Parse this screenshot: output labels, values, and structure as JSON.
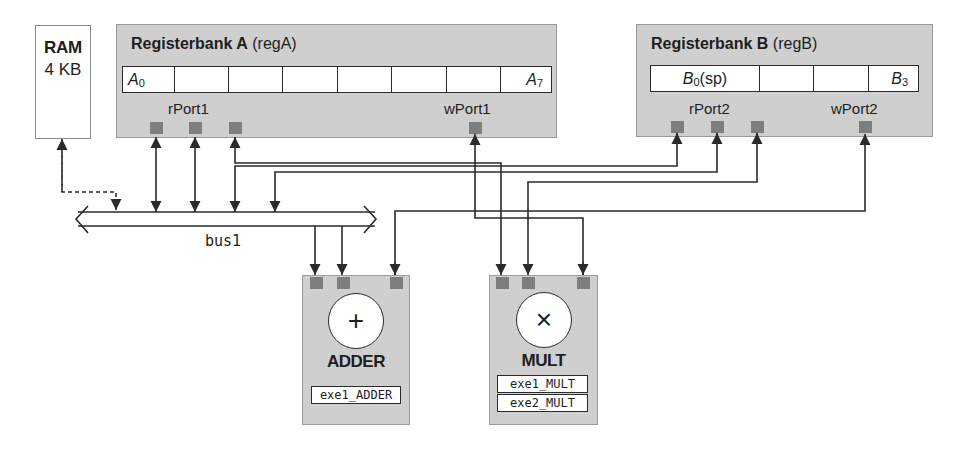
{
  "ram": {
    "title": "RAM",
    "size": "4 KB"
  },
  "register_bank_a": {
    "title_bold": "Registerbank A",
    "title_suffix": "(regA)",
    "cells": [
      {
        "reg": "A",
        "sub": "0"
      },
      {
        "reg": "",
        "sub": ""
      },
      {
        "reg": "",
        "sub": ""
      },
      {
        "reg": "",
        "sub": ""
      },
      {
        "reg": "",
        "sub": ""
      },
      {
        "reg": "",
        "sub": ""
      },
      {
        "reg": "",
        "sub": ""
      },
      {
        "reg": "A",
        "sub": "7"
      }
    ],
    "read_port_label": "rPort1",
    "write_port_label": "wPort1"
  },
  "register_bank_b": {
    "title_bold": "Registerbank B",
    "title_suffix": "(regB)",
    "cells": [
      {
        "reg": "B",
        "sub": "0",
        "extra": " (sp)"
      },
      {
        "reg": "",
        "sub": ""
      },
      {
        "reg": "",
        "sub": ""
      },
      {
        "reg": "B",
        "sub": "3"
      }
    ],
    "read_port_label": "rPort2",
    "write_port_label": "wPort2"
  },
  "bus": {
    "label": "bus1"
  },
  "adder": {
    "symbol": "+",
    "name": "ADDER",
    "stages": [
      "exe1_ADDER"
    ]
  },
  "mult": {
    "symbol": "×",
    "name": "MULT",
    "stages": [
      "exe1_MULT",
      "exe2_MULT"
    ]
  },
  "colors": {
    "block_fill": "#cfcfcf",
    "port_fill": "#7e7e7e",
    "line": "#2a2a2a"
  }
}
